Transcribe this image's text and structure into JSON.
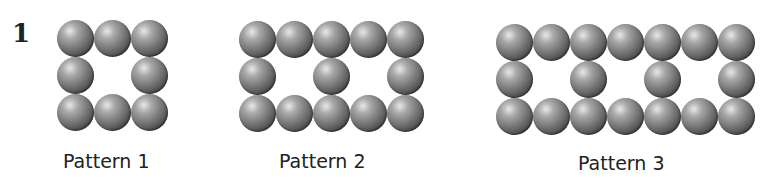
{
  "problem_number": "1",
  "patterns": [
    {
      "label": "Pattern 1",
      "cols": 3,
      "middle_cols": [
        0,
        2
      ],
      "left": 57,
      "top": 20,
      "label_left": 63,
      "label_top": 150
    },
    {
      "label": "Pattern 2",
      "cols": 5,
      "middle_cols": [
        0,
        2,
        4
      ],
      "left": 239,
      "top": 21,
      "label_left": 279,
      "label_top": 150
    },
    {
      "label": "Pattern 3",
      "cols": 7,
      "middle_cols": [
        0,
        2,
        4,
        6
      ],
      "left": 496,
      "top": 24,
      "label_left": 578,
      "label_top": 152
    }
  ],
  "ball_spacing": 37
}
